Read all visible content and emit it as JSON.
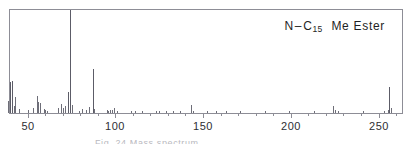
{
  "chart_data": {
    "type": "bar",
    "title_parts": {
      "prefix": "N",
      "dash": "–",
      "element": "C",
      "subscript": "15",
      "suffix": "Me Ester"
    },
    "xlabel": "",
    "ylabel": "",
    "xlim": [
      36,
      270
    ],
    "ylim": [
      0,
      100
    ],
    "grid": false,
    "legend": null,
    "tick_labels": [
      "50",
      "100",
      "150",
      "200",
      "250"
    ],
    "tick_values": [
      50,
      100,
      150,
      200,
      250
    ],
    "minor_tick_step": 10,
    "x": [
      39,
      40,
      41,
      42,
      43,
      45,
      50,
      53,
      55,
      56,
      57,
      59,
      60,
      61,
      67,
      69,
      70,
      71,
      73,
      74,
      75,
      79,
      81,
      83,
      85,
      87,
      88,
      95,
      96,
      97,
      98,
      99,
      101,
      109,
      111,
      115,
      123,
      125,
      129,
      133,
      137,
      143,
      144,
      152,
      157,
      163,
      171,
      185,
      199,
      213,
      224,
      225,
      227,
      241,
      253,
      255,
      256,
      257
    ],
    "values": [
      12,
      30,
      31,
      7,
      16,
      4,
      3,
      5,
      17,
      11,
      10,
      4,
      3,
      2,
      5,
      9,
      5,
      7,
      20,
      100,
      8,
      2,
      4,
      3,
      6,
      43,
      4,
      3,
      2,
      3,
      3,
      5,
      2,
      2,
      2,
      2,
      2,
      2,
      2,
      2,
      2,
      8,
      2,
      2,
      2,
      2,
      2,
      2,
      2,
      2,
      7,
      3,
      2,
      2,
      2,
      3,
      25,
      5
    ],
    "base_peak": 74,
    "molecular_ion": 256,
    "notable_peaks": [
      {
        "mz": 40,
        "intensity": 30
      },
      {
        "mz": 41,
        "intensity": 31
      },
      {
        "mz": 55,
        "intensity": 17
      },
      {
        "mz": 74,
        "intensity": 100
      },
      {
        "mz": 87,
        "intensity": 43
      },
      {
        "mz": 143,
        "intensity": 8
      },
      {
        "mz": 224,
        "intensity": 7
      },
      {
        "mz": 256,
        "intensity": 25
      }
    ],
    "colors": {
      "peak": "#6e6e78",
      "axis": "#8d8d96",
      "text": "#1f1f24",
      "background": "#ffffff"
    }
  },
  "bottom_caption": {
    "text": "Fig. 24  Mass spectrum"
  }
}
